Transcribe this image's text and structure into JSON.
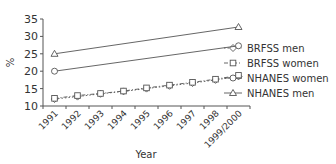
{
  "chart_data": {
    "type": "line",
    "title": "",
    "xlabel": "Year",
    "ylabel": "%",
    "ylim": [
      10,
      35
    ],
    "yticks": [
      10,
      15,
      20,
      25,
      30,
      35
    ],
    "categories": [
      "1991",
      "1992",
      "1993",
      "1994",
      "1995",
      "1996",
      "1997",
      "1998",
      "1999/2000"
    ],
    "grid": false,
    "legend_position": "right",
    "series": [
      {
        "name": "BRFSS men",
        "marker": "diamond",
        "line": "dotted",
        "values": [
          12.0,
          12.7,
          13.5,
          14.2,
          15.0,
          15.8,
          16.6,
          17.5,
          18.5
        ]
      },
      {
        "name": "BRFSS women",
        "marker": "square",
        "line": "dash-dot",
        "values": [
          12.2,
          13.0,
          13.6,
          14.3,
          15.2,
          16.0,
          16.8,
          17.7,
          18.8
        ]
      },
      {
        "name": "NHANES women",
        "marker": "circle",
        "line": "solid",
        "x": [
          "1991",
          "1999/2000"
        ],
        "values": [
          20.0,
          27.3
        ]
      },
      {
        "name": "NHANES men",
        "marker": "triangle",
        "line": "solid",
        "x": [
          "1991",
          "1999/2000"
        ],
        "values": [
          25.0,
          32.7
        ]
      }
    ]
  }
}
